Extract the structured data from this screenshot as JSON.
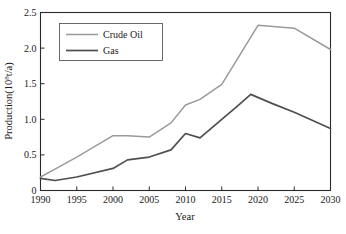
{
  "figure": {
    "name": "production-forecast-line-chart",
    "caption_fragment": ""
  },
  "chart_data": {
    "type": "line",
    "title": "",
    "xlabel": "Year",
    "ylabel": "Production(10⁸t/a)",
    "ylabel_base": "Production(10",
    "ylabel_exponent": "8",
    "ylabel_suffix": "t/a)",
    "xlim": [
      1990,
      2030
    ],
    "ylim": [
      0,
      2.5
    ],
    "grid": false,
    "legend_position": "upper-left",
    "xticks": [
      1990,
      1995,
      2000,
      2005,
      2010,
      2015,
      2020,
      2025,
      2030
    ],
    "xtick_labels": [
      "1990",
      "1995",
      "2000",
      "2005",
      "2010",
      "2015",
      "2020",
      "2025",
      "2030"
    ],
    "yticks": [
      0,
      0.5,
      1.0,
      1.5,
      2.0,
      2.5
    ],
    "ytick_labels": [
      "0",
      "0.5",
      "1.0",
      "1.5",
      "2.0",
      "2.5"
    ],
    "series": [
      {
        "name": "Crude Oil",
        "color": "#9a9a9a",
        "width": 1.5,
        "x": [
          1990,
          1992,
          1995,
          2000,
          2002,
          2005,
          2008,
          2010,
          2012,
          2015,
          2017,
          2020,
          2025,
          2030
        ],
        "values": [
          0.19,
          0.3,
          0.47,
          0.77,
          0.77,
          0.75,
          0.95,
          1.2,
          1.28,
          1.49,
          1.82,
          2.32,
          2.28,
          1.98
        ]
      },
      {
        "name": "Gas",
        "color": "#4f4f4f",
        "width": 1.7,
        "x": [
          1990,
          1992,
          1995,
          2000,
          2002,
          2005,
          2008,
          2010,
          2012,
          2015,
          2017,
          2019,
          2022,
          2025,
          2030
        ],
        "values": [
          0.17,
          0.14,
          0.19,
          0.31,
          0.43,
          0.47,
          0.57,
          0.8,
          0.74,
          1.0,
          1.17,
          1.35,
          1.22,
          1.1,
          0.87
        ]
      }
    ]
  },
  "legend": {
    "entries": [
      {
        "label": "Crude Oil",
        "color": "#9a9a9a"
      },
      {
        "label": "Gas",
        "color": "#4f4f4f"
      }
    ]
  }
}
